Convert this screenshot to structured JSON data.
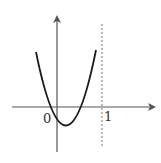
{
  "diagram": {
    "type": "function-graph",
    "curve": "parabola opening upward",
    "labels": {
      "origin": "0",
      "x_tick": "1"
    },
    "features": {
      "dashed_line": "x = 1",
      "roots": "two roots between 0 and 1 region: one slightly left of origin, one between 0 and 1",
      "vertex": "below x-axis, right of y-axis"
    },
    "colors": {
      "curve": "#1a1a1a",
      "axes": "#555555",
      "dashed": "#777777"
    }
  }
}
